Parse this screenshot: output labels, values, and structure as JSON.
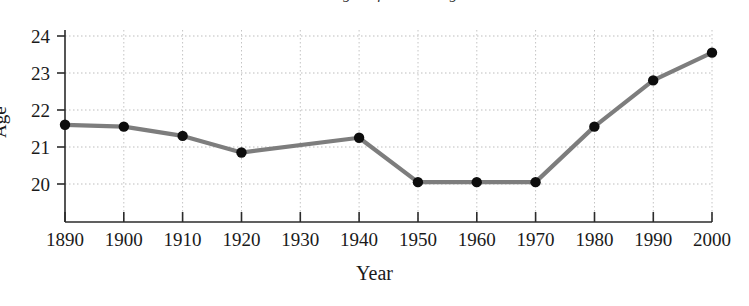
{
  "chart_data": {
    "type": "line",
    "title": "Median age at first marriage",
    "xlabel": "Year",
    "ylabel": "Age",
    "x": [
      1890,
      1900,
      1910,
      1920,
      1930,
      1940,
      1950,
      1960,
      1970,
      1980,
      1990,
      2000
    ],
    "values": [
      21.6,
      21.55,
      21.3,
      20.85,
      null,
      21.25,
      20.05,
      20.05,
      20.05,
      21.55,
      22.8,
      23.55
    ],
    "categories": [
      "1890",
      "1900",
      "1910",
      "1920",
      "1930",
      "1940",
      "1950",
      "1960",
      "1970",
      "1980",
      "1990",
      "2000"
    ],
    "series": [
      {
        "name": "Age",
        "points": [
          {
            "x": 1890,
            "y": 21.6
          },
          {
            "x": 1900,
            "y": 21.55
          },
          {
            "x": 1910,
            "y": 21.3
          },
          {
            "x": 1920,
            "y": 20.85
          },
          {
            "x": 1940,
            "y": 21.25
          },
          {
            "x": 1950,
            "y": 20.05
          },
          {
            "x": 1960,
            "y": 20.05
          },
          {
            "x": 1970,
            "y": 20.05
          },
          {
            "x": 1980,
            "y": 21.55
          },
          {
            "x": 1990,
            "y": 22.8
          },
          {
            "x": 2000,
            "y": 23.55
          }
        ]
      }
    ],
    "xlim": [
      1890,
      2000
    ],
    "ylim": [
      19.3,
      24.0
    ],
    "yticks": [
      20,
      21,
      22,
      23,
      24
    ],
    "ytick_labels": [
      "20",
      "21",
      "22",
      "23",
      "24"
    ],
    "xticks": [
      1890,
      1900,
      1910,
      1920,
      1930,
      1940,
      1950,
      1960,
      1970,
      1980,
      1990,
      2000
    ],
    "grid": true,
    "grid_style": "dotted",
    "legend": "none",
    "line_color": "#7d7d7d",
    "marker_color": "#0d0d0d",
    "axis_color": "#2b2b2b",
    "grid_color": "#bdbdbd",
    "background": "#ffffff"
  },
  "axes": {
    "ytick_labels": [
      "24",
      "23",
      "22",
      "21",
      "20"
    ],
    "xtick_labels": [
      "1890",
      "1900",
      "1910",
      "1920",
      "1930",
      "1940",
      "1950",
      "1960",
      "1970",
      "1980",
      "1990",
      "2000"
    ],
    "ylabel": "Age",
    "xlabel": "Year"
  },
  "title": {
    "text": "Median age at first marriage"
  }
}
